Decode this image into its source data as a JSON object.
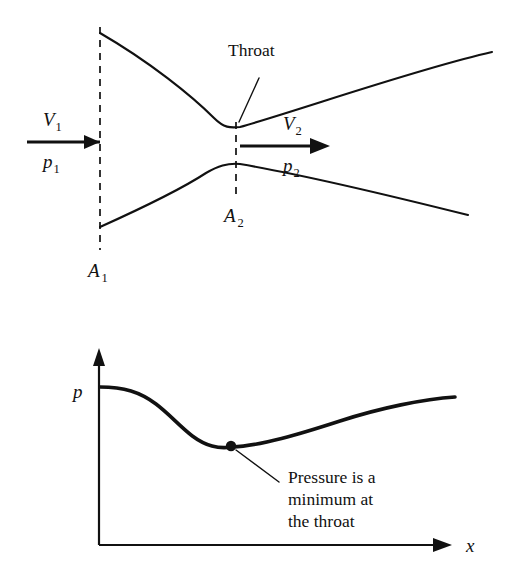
{
  "figure": {
    "ink_color": "#111111",
    "background_color": "#ffffff"
  },
  "nozzle_diagram": {
    "throat_label": "Throat",
    "inlet_velocity_label": "V",
    "inlet_velocity_sub": "1",
    "inlet_pressure_label": "p",
    "inlet_pressure_sub": "1",
    "outlet_velocity_label": "V",
    "outlet_velocity_sub": "2",
    "outlet_pressure_label": "p",
    "outlet_pressure_sub": "2",
    "inlet_area_label": "A",
    "inlet_area_sub": "1",
    "throat_area_label": "A",
    "throat_area_sub": "2"
  },
  "pressure_plot": {
    "y_axis_label": "p",
    "x_axis_label": "x",
    "annotation_line1": "Pressure is a",
    "annotation_line2": "minimum at",
    "annotation_line3": "the throat"
  },
  "chart_data": {
    "type": "line",
    "xlabel": "x",
    "ylabel": "p",
    "grid": false,
    "legend": "none",
    "axis_style": "arrow-terminated L-shaped axes, no tick marks, no numeric scale",
    "xlim": [
      0,
      1
    ],
    "ylim": [
      0,
      1
    ],
    "x": [
      0.0,
      0.08,
      0.17,
      0.26,
      0.34,
      0.43,
      0.52,
      0.61,
      0.7,
      0.79,
      0.87,
      1.0
    ],
    "values": [
      1.0,
      0.99,
      0.93,
      0.79,
      0.64,
      0.55,
      0.53,
      0.58,
      0.66,
      0.74,
      0.81,
      0.9
    ],
    "annotations": [
      {
        "text": "Pressure is a minimum at the throat",
        "points_to_x": 0.37,
        "points_to_y": 0.53
      }
    ],
    "markers": [
      {
        "name": "pressure-minimum",
        "x": 0.37,
        "y": 0.53
      }
    ]
  },
  "geometry": {
    "upper_wall_path": "M 100 33 C 150 62, 192 96, 214 118 C 224 128, 230 128, 240 127 C 300 110, 420 68, 492 52",
    "lower_wall_path": "M 100 227 C 140 209, 180 190, 206 173 C 218 166, 227 163, 240 164 C 300 174, 400 198, 468 215",
    "inlet_station_line": "M 100 27 L 100 250",
    "throat_station_line": "M 236 122 L 236 200",
    "inlet_arrow_line": "M 27 142 L 100 142",
    "inlet_arrow_head": "M 100 142 L 84 135 L 84 149 Z",
    "outlet_arrow_line": "M 240 146 L 320 146",
    "outlet_arrow_head": "M 330 146 L 310 138 L 310 154 Z",
    "throat_leader_line": "M 239 122 L 259 78",
    "y_axis_line": "M 99 545 L 99 358",
    "y_axis_head": "M 99 348 L 93 366 L 105 366 Z",
    "x_axis_line": "M 99 545 L 440 545",
    "x_axis_head": "M 452 545 L 433 538 L 433 552 Z",
    "pressure_curve_path": "M 100 387 C 124 387, 140 392, 156 404 C 176 419, 190 440, 212 446 C 219 448, 226 448, 232 447 C 260 446, 300 434, 340 421 C 380 408, 424 399, 455 397",
    "minimum_dot": {
      "cx": 231,
      "cy": 446,
      "r": 5.2
    },
    "annotation_leader_line": "M 236 450 L 279 482"
  }
}
